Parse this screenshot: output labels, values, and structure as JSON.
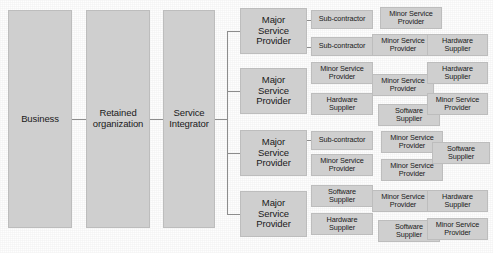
{
  "diagram": {
    "colors": {
      "box_fill": "#cfcfcf",
      "box_border": "#bdbdbd",
      "connector": "#8d8d8d",
      "text": "#1a1a1a",
      "background": "#ffffff"
    },
    "labels": {
      "business": "Business",
      "retained_organization": "Retained\norganization",
      "service_integrator": "Service\nIntegrator",
      "major_service_provider": "Major\nService\nProvider",
      "sub_contractor": "Sub-contractor",
      "minor_service_provider": "Minor Service\nProvider",
      "hardware_supplier": "Hardware\nSupplier",
      "software_supplier": "Software\nSupplier"
    },
    "columns": [
      {
        "name": "business",
        "boxes": [
          {
            "text": "Business",
            "x": 8,
            "y": 10,
            "w": 64,
            "h": 218
          }
        ]
      },
      {
        "name": "retained-organization",
        "boxes": [
          {
            "text": "Retained\norganization",
            "x": 86,
            "y": 10,
            "w": 64,
            "h": 218
          }
        ]
      },
      {
        "name": "service-integrator",
        "boxes": [
          {
            "text": "Service\nIntegrator",
            "x": 163,
            "y": 10,
            "w": 52,
            "h": 218
          }
        ]
      },
      {
        "name": "major-service-providers",
        "boxes": [
          {
            "text": "Major\nService\nProvider",
            "x": 240,
            "y": 8,
            "w": 67,
            "h": 46
          },
          {
            "text": "Major\nService\nProvider",
            "x": 240,
            "y": 68,
            "w": 67,
            "h": 46
          },
          {
            "text": "Major\nService\nProvider",
            "x": 240,
            "y": 130,
            "w": 67,
            "h": 46
          },
          {
            "text": "Major\nService\nProvider",
            "x": 240,
            "y": 191,
            "w": 67,
            "h": 46
          }
        ]
      },
      {
        "name": "tier-3-left",
        "boxes": [
          {
            "text": "Sub-contractor",
            "x": 311,
            "y": 10,
            "w": 62,
            "h": 19
          },
          {
            "text": "Sub-contractor",
            "x": 311,
            "y": 37,
            "w": 62,
            "h": 19
          },
          {
            "text": "Minor Service\nProvider",
            "x": 311,
            "y": 62,
            "w": 62,
            "h": 22
          },
          {
            "text": "Hardware\nSupplier",
            "x": 311,
            "y": 93,
            "w": 62,
            "h": 22
          },
          {
            "text": "Sub-contractor",
            "x": 311,
            "y": 131,
            "w": 62,
            "h": 19
          },
          {
            "text": "Minor Service\nProvider",
            "x": 311,
            "y": 154,
            "w": 62,
            "h": 22
          },
          {
            "text": "Software\nSupplier",
            "x": 311,
            "y": 185,
            "w": 62,
            "h": 22
          },
          {
            "text": "Hardware\nSupplier",
            "x": 311,
            "y": 213,
            "w": 62,
            "h": 22
          }
        ]
      },
      {
        "name": "tier-3-middle",
        "boxes": [
          {
            "text": "Minor Service\nProvider",
            "x": 380,
            "y": 7,
            "w": 62,
            "h": 22
          },
          {
            "text": "Minor Service\nProvider",
            "x": 372,
            "y": 34,
            "w": 62,
            "h": 22
          },
          {
            "text": "Minor Service\nProvider",
            "x": 372,
            "y": 74,
            "w": 62,
            "h": 22
          },
          {
            "text": "Software\nSupplier",
            "x": 378,
            "y": 104,
            "w": 62,
            "h": 22
          },
          {
            "text": "Minor Service\nProvider",
            "x": 381,
            "y": 131,
            "w": 62,
            "h": 22
          },
          {
            "text": "Minor Service\nProvider",
            "x": 381,
            "y": 159,
            "w": 62,
            "h": 22
          },
          {
            "text": "Minor Service\nProvider",
            "x": 372,
            "y": 190,
            "w": 62,
            "h": 22
          },
          {
            "text": "Software\nSupplier",
            "x": 378,
            "y": 220,
            "w": 62,
            "h": 22
          }
        ]
      },
      {
        "name": "tier-3-right",
        "boxes": [
          {
            "text": "Hardware\nSupplier",
            "x": 427,
            "y": 34,
            "w": 61,
            "h": 22
          },
          {
            "text": "Hardware\nSupplier",
            "x": 427,
            "y": 62,
            "w": 61,
            "h": 22
          },
          {
            "text": "Minor Service\nProvider",
            "x": 427,
            "y": 93,
            "w": 61,
            "h": 22
          },
          {
            "text": "Software\nSupplier",
            "x": 432,
            "y": 142,
            "w": 58,
            "h": 22
          },
          {
            "text": "Hardware\nSupplier",
            "x": 427,
            "y": 190,
            "w": 61,
            "h": 22
          },
          {
            "text": "Minor Service\nProvider",
            "x": 427,
            "y": 218,
            "w": 61,
            "h": 22
          }
        ]
      }
    ],
    "connectors": [
      {
        "name": "business-to-retained",
        "orient": "h",
        "x": 72,
        "y": 119,
        "len": 14
      },
      {
        "name": "retained-to-integrator",
        "orient": "h",
        "x": 150,
        "y": 119,
        "len": 13
      },
      {
        "name": "integrator-trunk",
        "orient": "v",
        "x": 227,
        "y": 31,
        "len": 183
      },
      {
        "name": "integrator-stem",
        "orient": "h",
        "x": 215,
        "y": 119,
        "len": 13
      },
      {
        "name": "branch-msp-1",
        "orient": "h",
        "x": 227,
        "y": 31,
        "len": 13
      },
      {
        "name": "branch-msp-2",
        "orient": "h",
        "x": 227,
        "y": 91,
        "len": 13
      },
      {
        "name": "branch-msp-3",
        "orient": "h",
        "x": 227,
        "y": 153,
        "len": 13
      },
      {
        "name": "branch-msp-4",
        "orient": "h",
        "x": 227,
        "y": 214,
        "len": 13
      },
      {
        "name": "msp1-to-sub-1",
        "orient": "h",
        "x": 307,
        "y": 20,
        "len": 5
      },
      {
        "name": "msp1-to-sub-2",
        "orient": "h",
        "x": 307,
        "y": 47,
        "len": 5
      },
      {
        "name": "msp3-to-sub-1",
        "orient": "h",
        "x": 307,
        "y": 140,
        "len": 5
      }
    ]
  }
}
